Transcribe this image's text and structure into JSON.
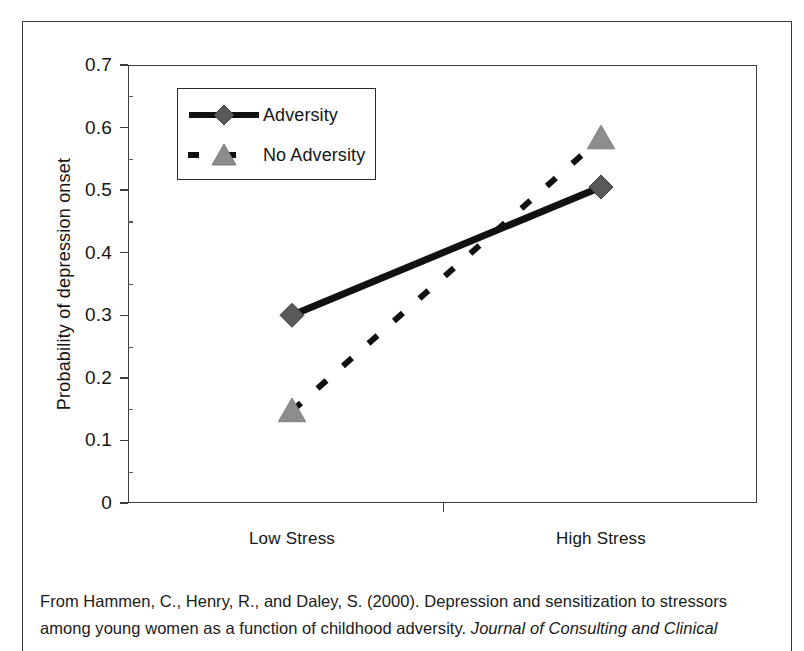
{
  "figure": {
    "caption_line1": "From Hammen, C., Henry, R., and Daley, S. (2000). Depression and sensitization to stressors",
    "caption_line2_plain": "among young women as a function of childhood adversity. ",
    "caption_line2_italic": "Journal of Consulting and Clinical"
  },
  "chart_data": {
    "type": "line",
    "title": "",
    "xlabel": "",
    "ylabel": "Probability of depression onset",
    "categories": [
      "Low Stress",
      "High Stress"
    ],
    "ylim": [
      0,
      0.7
    ],
    "ytick_labels": [
      "0",
      "0.1",
      "0.2",
      "0.3",
      "0.4",
      "0.5",
      "0.6",
      "0.7"
    ],
    "ytick_values": [
      0,
      0.1,
      0.2,
      0.3,
      0.4,
      0.5,
      0.6,
      0.7
    ],
    "grid": false,
    "legend_position": "upper-left-inside",
    "series": [
      {
        "name": "Adversity",
        "values": [
          0.3,
          0.505
        ],
        "marker": "diamond",
        "marker_color": "#595959",
        "line_style": "solid",
        "line_color": "#111111"
      },
      {
        "name": "No Adversity",
        "values": [
          0.147,
          0.583
        ],
        "marker": "triangle",
        "marker_color": "#8d8d8d",
        "line_style": "dashed",
        "line_color": "#111111"
      }
    ]
  }
}
